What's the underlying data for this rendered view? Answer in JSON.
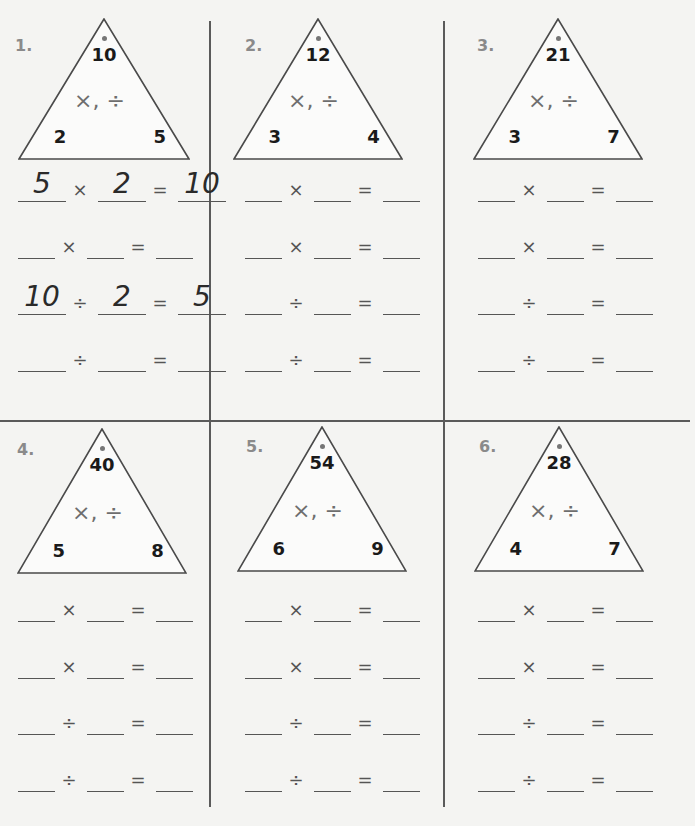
{
  "worksheet": {
    "problems": [
      {
        "label": "1.",
        "triangle": {
          "top": "10",
          "left": "2",
          "right": "5",
          "ops": "×, ÷"
        },
        "equations": [
          {
            "a": "5",
            "op": "×",
            "b": "2",
            "eq": "=",
            "c": "10"
          },
          {
            "a": "",
            "op": "×",
            "b": "",
            "eq": "=",
            "c": ""
          },
          {
            "a": "10",
            "op": "÷",
            "b": "2",
            "eq": "=",
            "c": "5"
          },
          {
            "a": "",
            "op": "÷",
            "b": "",
            "eq": "=",
            "c": ""
          }
        ]
      },
      {
        "label": "2.",
        "triangle": {
          "top": "12",
          "left": "3",
          "right": "4",
          "ops": "×, ÷"
        },
        "equations": [
          {
            "a": "",
            "op": "×",
            "b": "",
            "eq": "=",
            "c": ""
          },
          {
            "a": "",
            "op": "×",
            "b": "",
            "eq": "=",
            "c": ""
          },
          {
            "a": "",
            "op": "÷",
            "b": "",
            "eq": "=",
            "c": ""
          },
          {
            "a": "",
            "op": "÷",
            "b": "",
            "eq": "=",
            "c": ""
          }
        ]
      },
      {
        "label": "3.",
        "triangle": {
          "top": "21",
          "left": "3",
          "right": "7",
          "ops": "×, ÷"
        },
        "equations": [
          {
            "a": "",
            "op": "×",
            "b": "",
            "eq": "=",
            "c": ""
          },
          {
            "a": "",
            "op": "×",
            "b": "",
            "eq": "=",
            "c": ""
          },
          {
            "a": "",
            "op": "÷",
            "b": "",
            "eq": "=",
            "c": ""
          },
          {
            "a": "",
            "op": "÷",
            "b": "",
            "eq": "=",
            "c": ""
          }
        ]
      },
      {
        "label": "4.",
        "triangle": {
          "top": "40",
          "left": "5",
          "right": "8",
          "ops": "×, ÷"
        },
        "equations": [
          {
            "a": "",
            "op": "×",
            "b": "",
            "eq": "=",
            "c": ""
          },
          {
            "a": "",
            "op": "×",
            "b": "",
            "eq": "=",
            "c": ""
          },
          {
            "a": "",
            "op": "÷",
            "b": "",
            "eq": "=",
            "c": ""
          },
          {
            "a": "",
            "op": "÷",
            "b": "",
            "eq": "=",
            "c": ""
          }
        ]
      },
      {
        "label": "5.",
        "triangle": {
          "top": "54",
          "left": "6",
          "right": "9",
          "ops": "×, ÷"
        },
        "equations": [
          {
            "a": "",
            "op": "×",
            "b": "",
            "eq": "=",
            "c": ""
          },
          {
            "a": "",
            "op": "×",
            "b": "",
            "eq": "=",
            "c": ""
          },
          {
            "a": "",
            "op": "÷",
            "b": "",
            "eq": "=",
            "c": ""
          },
          {
            "a": "",
            "op": "÷",
            "b": "",
            "eq": "=",
            "c": ""
          }
        ]
      },
      {
        "label": "6.",
        "triangle": {
          "top": "28",
          "left": "4",
          "right": "7",
          "ops": "×, ÷"
        },
        "equations": [
          {
            "a": "",
            "op": "×",
            "b": "",
            "eq": "=",
            "c": ""
          },
          {
            "a": "",
            "op": "×",
            "b": "",
            "eq": "=",
            "c": ""
          },
          {
            "a": "",
            "op": "÷",
            "b": "",
            "eq": "=",
            "c": ""
          },
          {
            "a": "",
            "op": "÷",
            "b": "",
            "eq": "=",
            "c": ""
          }
        ]
      }
    ]
  }
}
